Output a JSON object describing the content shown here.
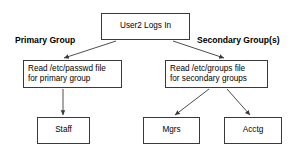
{
  "diagram": {
    "background_color": "#ffffff",
    "line_color": "#3a3a3a",
    "text_color": "#000000",
    "captions": {
      "primary": "Primary Group",
      "secondary": "Secondary Group(s)"
    },
    "nodes": {
      "login": {
        "line1": "User2 Logs In"
      },
      "passwd": {
        "line1": "Read /etc/passwd file",
        "line2": "for primary group"
      },
      "groups": {
        "line1": "Read /etc/groups file",
        "line2": "for secondary groups"
      },
      "staff": {
        "line1": "Staff"
      },
      "mgrs": {
        "line1": "Mgrs"
      },
      "acctg": {
        "line1": "Acctg"
      }
    },
    "edges": [
      {
        "from": "login",
        "to": "passwd",
        "style": "arrow"
      },
      {
        "from": "login",
        "to": "groups",
        "style": "arrow"
      },
      {
        "from": "passwd",
        "to": "staff",
        "style": "arrow"
      },
      {
        "from": "groups",
        "to": "mgrs",
        "style": "arrow"
      },
      {
        "from": "groups",
        "to": "acctg",
        "style": "arrow"
      }
    ]
  }
}
